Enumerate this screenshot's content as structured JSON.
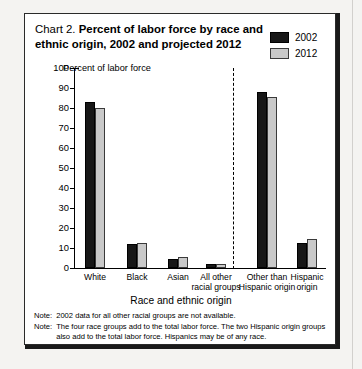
{
  "chart_data": {
    "type": "bar",
    "title": "Chart 2.  Percent of labor force by race and ethnic origin, 2002 and projected 2012",
    "title_lead": "Chart 2.",
    "title_bold_line1": "Percent of labor force by race and",
    "title_bold_line2": "ethnic origin, 2002 and projected 2012",
    "xlabel": "Race and ethnic origin",
    "ylabel": "Percent of labor force",
    "ylim": [
      0,
      100
    ],
    "ytick_step": 10,
    "yticks": [
      "0",
      "10",
      "20",
      "30",
      "40",
      "50",
      "60",
      "70",
      "80",
      "90",
      "100"
    ],
    "grid": false,
    "legend_position": "top-right",
    "categories": [
      "White",
      "Black",
      "Asian",
      "All other\nracial groups",
      "Other than\nHispanic origin",
      "Hispanic\norigin"
    ],
    "category_lines": [
      [
        "White"
      ],
      [
        "Black"
      ],
      [
        "Asian"
      ],
      [
        "All other",
        "racial groups"
      ],
      [
        "Other than",
        "Hispanic origin"
      ],
      [
        "Hispanic",
        "origin"
      ]
    ],
    "series": [
      {
        "name": "2002",
        "color": "#171717",
        "values": [
          83,
          12,
          4.5,
          1.8,
          88,
          12.5
        ]
      },
      {
        "name": "2012",
        "color": "#c9c9c9",
        "values": [
          80,
          12.5,
          5.5,
          2.2,
          85.5,
          14.5
        ]
      }
    ],
    "divider_after_category_index": 3,
    "notes": [
      {
        "tag": "Note:",
        "text": "2002 data for all other racial groups are not available."
      },
      {
        "tag": "Note:",
        "text": "The four race groups add to the total labor force. The two Hispanic origin groups also add to the total labor force. Hispanics may be of any race."
      }
    ]
  }
}
